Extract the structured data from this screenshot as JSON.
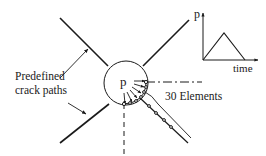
{
  "diagram": {
    "labels": {
      "crack_paths_line1": "Predefined",
      "crack_paths_line2": "crack paths",
      "load_point": "p",
      "elements": "30 Elements"
    },
    "inset_plot": {
      "y_axis_label": "p",
      "x_axis_label": "time",
      "shape": "triangular load pulse"
    },
    "colors": {
      "stroke": "#1a1a1a",
      "background": "#ffffff"
    }
  }
}
